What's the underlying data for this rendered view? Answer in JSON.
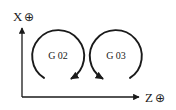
{
  "diagram": {
    "background_color": "#ffffff",
    "stroke_color": "#1a1a1a",
    "axes": {
      "vertical": {
        "label": "X",
        "sign_symbol": "⊕",
        "sign_icon_name": "circled-plus-icon",
        "direction": "up"
      },
      "horizontal": {
        "label": "Z",
        "sign_symbol": "⊕",
        "sign_icon_name": "circled-plus-icon",
        "direction": "right"
      }
    },
    "arcs": [
      {
        "label": "G 02",
        "direction": "clockwise",
        "arrow_position": "bottom-right"
      },
      {
        "label": "G 03",
        "direction": "counter-clockwise",
        "arrow_position": "bottom-left"
      }
    ]
  }
}
